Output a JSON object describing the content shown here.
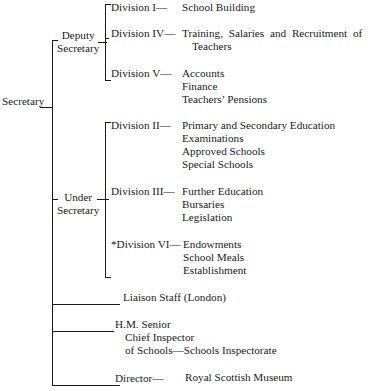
{
  "root": {
    "label": "Secretary"
  },
  "deputy": {
    "label_line1": "Deputy",
    "label_line2": "Secretary",
    "divisions": [
      {
        "name": "Division I—",
        "duties": [
          "School Building"
        ]
      },
      {
        "name": "Division IV—",
        "duties_line1": "Training, Salaries and Recruitment of",
        "duties_line2": "Teachers"
      },
      {
        "name": "Division V—",
        "duties": [
          "Accounts",
          "Finance",
          "Teachers’ Pensions"
        ]
      }
    ]
  },
  "under": {
    "label_line1": "Under",
    "label_line2": "Secretary",
    "divisions": [
      {
        "name": "Division II—",
        "duties": [
          "Primary and Secondary Education",
          "Examinations",
          "Approved Schools",
          "Special Schools"
        ]
      },
      {
        "name": "Division III—",
        "duties": [
          "Further Education",
          "Bursaries",
          "Legislation"
        ]
      },
      {
        "name": "*Division VI—",
        "duties": [
          "Endowments",
          "School Meals",
          "Establishment"
        ]
      }
    ]
  },
  "other_branches": [
    {
      "label": "Liaison Staff (London)"
    },
    {
      "line1": "H.M. Senior",
      "line2": "Chief Inspector",
      "line3": "of Schools—Schools Inspectorate"
    },
    {
      "head": "Director—",
      "unit": "Royal Scottish Museum"
    }
  ]
}
